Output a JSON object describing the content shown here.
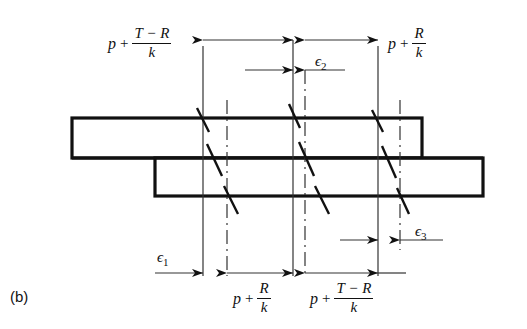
{
  "figure": {
    "caption": "(b)",
    "type": "engineering-stress-distribution-diagram"
  },
  "labels": {
    "top_left_pressure": {
      "lead": "p",
      "op": "+",
      "num": "T − R",
      "den": "k"
    },
    "top_right_pressure": {
      "lead": "p",
      "op": "+",
      "num": "R",
      "den": "k"
    },
    "bottom_left_pressure": {
      "lead": "p",
      "op": "+",
      "num": "R",
      "den": "k"
    },
    "bottom_right_pressure": {
      "lead": "p",
      "op": "+",
      "num": "T − R",
      "den": "k"
    },
    "epsilon_1": {
      "sym": "ϵ",
      "sub": "1"
    },
    "epsilon_2": {
      "sym": "ϵ",
      "sub": "2"
    },
    "epsilon_3": {
      "sym": "ϵ",
      "sub": "3"
    }
  },
  "colors": {
    "ink": "#111111",
    "background": "#ffffff",
    "thin_line": "#333333"
  },
  "geometry": {
    "upper_bar": {
      "x": 72,
      "y": 118,
      "width": 350,
      "height": 40
    },
    "lower_bar": {
      "x": 155,
      "y": 158,
      "width": 328,
      "height": 38
    },
    "reference_lines_x": [
      203,
      227,
      293,
      305,
      378,
      400
    ],
    "top_dimension_y": 40,
    "eps2_dimension_y": 70,
    "eps3_dimension_y": 240,
    "bottom_dimension_y": 273
  }
}
